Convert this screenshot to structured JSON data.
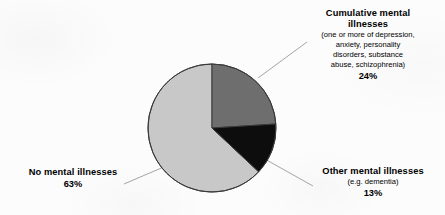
{
  "chart_data": {
    "type": "pie",
    "title": "",
    "subtitle": "",
    "xlabel": "",
    "ylabel": "",
    "legend_position": "callout-labels",
    "grid": false,
    "unit": "%",
    "start_angle_deg": 0,
    "direction": "clockwise",
    "categories": [
      "Cumulative mental illnesses",
      "Other mental illnesses",
      "No mental illnesses"
    ],
    "values": [
      24,
      13,
      63
    ],
    "slices": [
      {
        "name": "Cumulative mental illnesses",
        "title_lines": [
          "Cumulative mental",
          "illnesses"
        ],
        "detail_lines": [
          "(one or more of depression,",
          "anxiety, personality",
          "disorders, substance",
          "abuse, schizophrenia)"
        ],
        "value": 24,
        "percent_label": "24%",
        "color": "#6e6e6e",
        "start_deg": 0,
        "end_deg": 86.4
      },
      {
        "name": "Other mental illnesses",
        "title_lines": [
          "Other mental illnesses"
        ],
        "detail_lines": [
          "(e.g. dementia)"
        ],
        "value": 13,
        "percent_label": "13%",
        "color": "#0d0d0d",
        "start_deg": 86.4,
        "end_deg": 133.2
      },
      {
        "name": "No mental illnesses",
        "title_lines": [
          "No mental illnesses"
        ],
        "detail_lines": [],
        "value": 63,
        "percent_label": "63%",
        "color": "#c8c8c8",
        "start_deg": 133.2,
        "end_deg": 360
      }
    ]
  },
  "labels": {
    "cumulative": {
      "line1": "Cumulative mental",
      "line2": "illnesses",
      "detail1": "(one or more of depression,",
      "detail2": "anxiety, personality",
      "detail3": "disorders, substance",
      "detail4": "abuse, schizophrenia)",
      "percent": "24%"
    },
    "none": {
      "line1": "No mental illnesses",
      "percent": "63%"
    },
    "other": {
      "line1": "Other mental illnesses",
      "detail1": "(e.g. dementia)",
      "percent": "13%"
    }
  },
  "colors": {
    "cumulative_slice": "#6e6e6e",
    "other_slice": "#0d0d0d",
    "none_slice": "#c8c8c8",
    "outline": "#3a3a3a",
    "leader_line": "#9a9a9a",
    "background": "#fcfcfc",
    "text": "#000000"
  },
  "geometry": {
    "center_x": 212,
    "center_y": 128,
    "radius": 64
  }
}
